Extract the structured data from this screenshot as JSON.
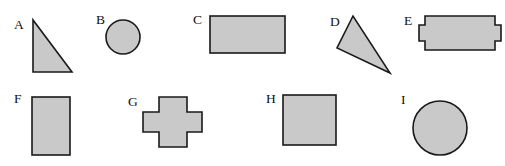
{
  "figure": {
    "width": 505,
    "height": 166,
    "background_color": "#ffffff",
    "shape_fill_color": "#c9c9c9",
    "shape_stroke_color": "#1a1a1a",
    "label_color": "#111111",
    "rows": 2,
    "shape_count": 9
  },
  "shapes": [
    {
      "id": "A",
      "label": "A",
      "kind": "right-triangle",
      "row": 1,
      "label_x": 14,
      "label_y": 29,
      "points": "33,20 33,72 72,72",
      "bbox": {
        "x": 33,
        "y": 20,
        "width": 39,
        "height": 52
      }
    },
    {
      "id": "B",
      "label": "B",
      "kind": "circle",
      "row": 1,
      "label_x": 96,
      "label_y": 24,
      "cx": 123,
      "cy": 37,
      "r": 17,
      "bbox": {
        "x": 106,
        "y": 20,
        "width": 34,
        "height": 34
      }
    },
    {
      "id": "C",
      "label": "C",
      "kind": "rectangle",
      "row": 1,
      "label_x": 193,
      "label_y": 24,
      "bbox": {
        "x": 210,
        "y": 16,
        "width": 75,
        "height": 37
      }
    },
    {
      "id": "D",
      "label": "D",
      "kind": "scalene-triangle",
      "row": 1,
      "label_x": 330,
      "label_y": 26,
      "points": "353,16 337,48 390,73",
      "bbox": {
        "x": 337,
        "y": 16,
        "width": 53,
        "height": 57
      }
    },
    {
      "id": "E",
      "label": "E",
      "kind": "rectangle-with-side-tabs",
      "row": 1,
      "label_x": 404,
      "label_y": 25,
      "points": "425,16 495,16 495,25 501,25 501,41 495,41 495,50 425,50 425,41 419,41 419,25 425,25",
      "bbox": {
        "x": 419,
        "y": 16,
        "width": 82,
        "height": 34
      }
    },
    {
      "id": "F",
      "label": "F",
      "kind": "vertical-rectangle",
      "row": 2,
      "label_x": 14,
      "label_y": 103,
      "bbox": {
        "x": 32,
        "y": 97,
        "width": 38,
        "height": 58
      }
    },
    {
      "id": "G",
      "label": "G",
      "kind": "cross",
      "row": 2,
      "label_x": 128,
      "label_y": 106,
      "points": "159,97 187,97 187,112 202,112 202,132 187,132 187,147 159,147 159,132 143,132 143,112 159,112",
      "bbox": {
        "x": 143,
        "y": 97,
        "width": 59,
        "height": 50
      }
    },
    {
      "id": "H",
      "label": "H",
      "kind": "square",
      "row": 2,
      "label_x": 266,
      "label_y": 103,
      "bbox": {
        "x": 283,
        "y": 95,
        "width": 53,
        "height": 50
      }
    },
    {
      "id": "I",
      "label": "I",
      "kind": "circle",
      "row": 2,
      "label_x": 401,
      "label_y": 104,
      "cx": 440,
      "cy": 128,
      "r": 27,
      "bbox": {
        "x": 413,
        "y": 101,
        "width": 54,
        "height": 54
      }
    }
  ]
}
